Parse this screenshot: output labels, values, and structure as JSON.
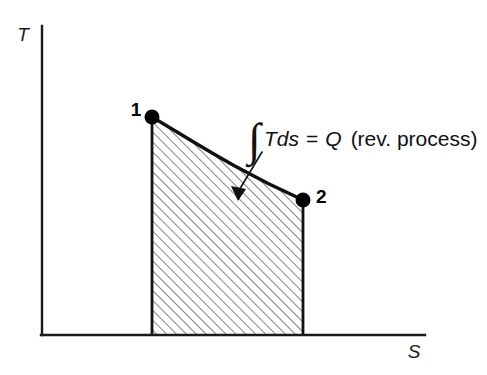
{
  "figure": {
    "background_color": "#ffffff",
    "ink_color": "#111111"
  },
  "axes": {
    "y_label": "T",
    "x_label": "S",
    "origin": {
      "x": 42,
      "y": 335
    },
    "y_top": 26,
    "x_right": 425,
    "line_width": 2.4,
    "color": "#1a1a1a"
  },
  "points": [
    {
      "name": "state-1",
      "label": "1",
      "x": 152,
      "y": 117,
      "label_x": 136,
      "label_y": 116,
      "radius": 7.5
    },
    {
      "name": "state-2",
      "label": "2",
      "x": 303,
      "y": 200,
      "label_x": 316,
      "label_y": 203,
      "radius": 7.5
    }
  ],
  "process_curve": {
    "description": "reversible process path from state 1 to state 2",
    "path": "M 152 117 C 196 143, 236 170, 303 200",
    "stroke_width": 3.4,
    "color": "#111111"
  },
  "shaded_area": {
    "description": "area under curve equals heat transfer Q",
    "path": "M 152 117 C 196 143, 236 170, 303 200 L 303 334 L 152 334 Z",
    "hatch_angle_deg": 45,
    "hatch_spacing": 7,
    "hatch_width": 1.1,
    "hatch_color": "#2b2b2b",
    "fill_color": "#ffffff"
  },
  "annotation": {
    "integral_symbol": "∫",
    "integrand": "Tds",
    "equals": "=",
    "quantity": "Q",
    "qualifier": "(rev. process)",
    "full_text": "∫Tds = Q (rev. process)",
    "text_x": 248,
    "text_y": 146,
    "leader_line": {
      "from_x": 262,
      "from_y": 152,
      "to_x": 238,
      "to_y": 192,
      "stroke_width": 1.6
    },
    "arrow_head": {
      "x": 238,
      "y": 199,
      "points": "238,201 231,186 246,189"
    }
  },
  "colors": {
    "ink": "#111111",
    "axis": "#1a1a1a",
    "hatch": "#2b2b2b",
    "background": "#ffffff"
  }
}
